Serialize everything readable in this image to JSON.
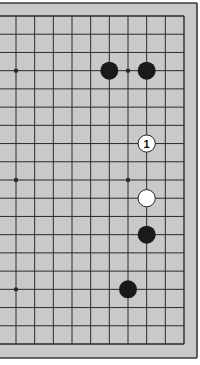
{
  "diagram": {
    "type": "go-board-fragment",
    "board_size": 19,
    "visible_columns": [
      10,
      19
    ],
    "visible_rows": [
      1,
      19
    ],
    "colors": {
      "board_fill": "#c9c9c9",
      "grid_line": "#2a2a2a",
      "border": "#3a3a3a",
      "outside": "#ffffff",
      "black_stone": "#1a1a1a",
      "white_stone": "#ffffff",
      "white_stone_outline": "#222222"
    },
    "star_points": [
      {
        "col": 10,
        "row": 4
      },
      {
        "col": 16,
        "row": 4
      },
      {
        "col": 10,
        "row": 10
      },
      {
        "col": 16,
        "row": 10
      },
      {
        "col": 10,
        "row": 16
      },
      {
        "col": 16,
        "row": 16
      }
    ],
    "stones": [
      {
        "color": "black",
        "col": 15,
        "row": 4,
        "label": ""
      },
      {
        "color": "black",
        "col": 17,
        "row": 4,
        "label": ""
      },
      {
        "color": "white",
        "col": 17,
        "row": 8,
        "label": "1"
      },
      {
        "color": "white",
        "col": 17,
        "row": 11,
        "label": ""
      },
      {
        "color": "black",
        "col": 17,
        "row": 13,
        "label": ""
      },
      {
        "color": "black",
        "col": 16,
        "row": 16,
        "label": ""
      }
    ]
  },
  "caption": {
    "text": "· ·"
  }
}
